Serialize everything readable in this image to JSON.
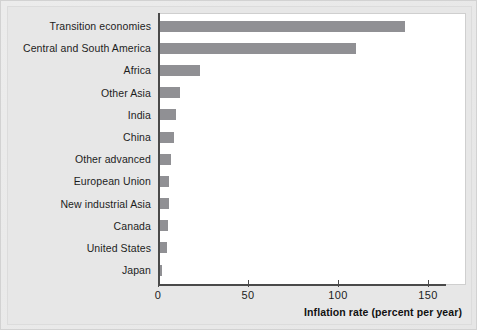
{
  "chart_data": {
    "type": "bar",
    "orientation": "horizontal",
    "title": "",
    "xlabel": "Inflation rate (percent per year)",
    "ylabel": "",
    "xlim": [
      0,
      160
    ],
    "xticks": [
      0,
      50,
      100,
      150
    ],
    "xtick_labels": [
      "0",
      "50",
      "100",
      "150"
    ],
    "grid": false,
    "legend": null,
    "bar_color": "#909094",
    "axis_color": "#4a4a4a",
    "plot_background": "#ffffff",
    "figure_background": "#e7e7e7",
    "categories": [
      "Transition economies",
      "Central and South America",
      "Africa",
      "Other Asia",
      "India",
      "China",
      "Other advanced",
      "European Union",
      "New industrial Asia",
      "Canada",
      "United States",
      "Japan"
    ],
    "values": [
      136,
      109,
      22,
      11,
      9,
      7.5,
      6,
      5,
      5,
      4.5,
      4,
      0.5
    ]
  }
}
